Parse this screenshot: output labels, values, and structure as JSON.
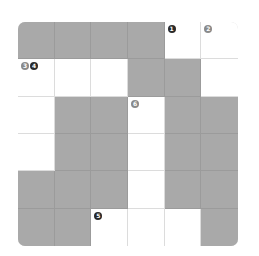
{
  "puzzle": {
    "rows": 6,
    "cols": 6,
    "grid": [
      [
        "block",
        "block",
        "block",
        "block",
        "open",
        "open"
      ],
      [
        "open",
        "open",
        "open",
        "block",
        "block",
        "open"
      ],
      [
        "open",
        "block",
        "block",
        "open",
        "block",
        "block"
      ],
      [
        "open",
        "block",
        "block",
        "open",
        "block",
        "block"
      ],
      [
        "block",
        "block",
        "block",
        "open",
        "block",
        "block"
      ],
      [
        "block",
        "block",
        "open",
        "open",
        "open",
        "block"
      ]
    ],
    "clue_numbers": [
      {
        "number": "1",
        "row": 0,
        "col": 4,
        "style": "dark",
        "offset": 0
      },
      {
        "number": "2",
        "row": 0,
        "col": 5,
        "style": "gray",
        "offset": 0
      },
      {
        "number": "3",
        "row": 1,
        "col": 0,
        "style": "gray",
        "offset": 0
      },
      {
        "number": "4",
        "row": 1,
        "col": 0,
        "style": "dark",
        "offset": 9
      },
      {
        "number": "6",
        "row": 2,
        "col": 3,
        "style": "gray",
        "offset": 0
      },
      {
        "number": "5",
        "row": 5,
        "col": 2,
        "style": "dark",
        "offset": 0
      }
    ]
  },
  "colors": {
    "block": "#a9a9a9",
    "open": "#ffffff",
    "badge_dark": "#2a2a2a",
    "badge_gray": "#8a8a8a"
  }
}
